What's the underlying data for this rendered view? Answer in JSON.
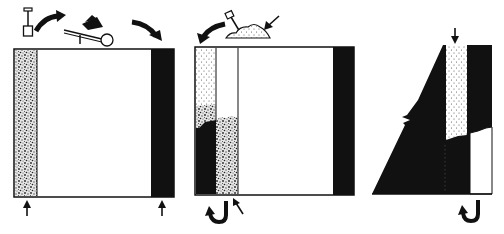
{
  "diagram": {
    "description": "Three-stage schematic of strip mining with spoil backfill",
    "colors": {
      "ink": "#111111",
      "paper": "#ffffff",
      "spoil_speckle": "#d8d8d8",
      "dot": "#555555"
    },
    "panels": [
      {
        "id": "stage-1",
        "label": "Stage 1: initial cut",
        "icons": [
          "shovel-icon",
          "curved-arrow-icon",
          "wheelbarrow-icon",
          "curved-arrow-icon"
        ],
        "bottom_arrows": 2
      },
      {
        "id": "stage-2",
        "label": "Stage 2: backfill of excavated strip",
        "icons": [
          "curved-arrow-icon",
          "shovel-in-soil-pile-icon",
          "straight-arrow-icon"
        ],
        "bottom_icons": [
          "u-turn-arrow-icon",
          "straight-arrow-icon"
        ]
      },
      {
        "id": "stage-3",
        "label": "Stage 3: final profile",
        "icons": [
          "down-arrow-icon"
        ],
        "bottom_icons": [
          "u-turn-arrow-icon"
        ]
      }
    ]
  }
}
